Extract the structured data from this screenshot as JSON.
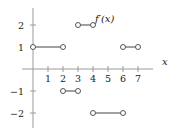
{
  "chart_data": {
    "type": "line",
    "subtype": "piecewise-constant step function with open endpoints",
    "title": "",
    "function_label": "f'(x)",
    "xlabel": "x",
    "ylabel": "",
    "xlim": [
      -0.7,
      7.9
    ],
    "ylim": [
      -2.7,
      2.8
    ],
    "x_ticks": [
      1,
      2,
      3,
      4,
      5,
      6,
      7
    ],
    "y_ticks": [
      -2,
      -1,
      1,
      2
    ],
    "grid": false,
    "legend": null,
    "segments": [
      {
        "x_start": 0,
        "x_end": 2,
        "y": 1,
        "start_open": true,
        "end_open": true
      },
      {
        "x_start": 2,
        "x_end": 3,
        "y": -1,
        "start_open": true,
        "end_open": true
      },
      {
        "x_start": 3,
        "x_end": 4,
        "y": 2,
        "start_open": true,
        "end_open": true
      },
      {
        "x_start": 4,
        "x_end": 6,
        "y": -2,
        "start_open": true,
        "end_open": true
      },
      {
        "x_start": 6,
        "x_end": 7,
        "y": 1,
        "start_open": true,
        "end_open": true
      }
    ],
    "annotations": [
      {
        "text": "f'(x)",
        "near": {
          "x": 4,
          "y": 2
        }
      }
    ]
  },
  "labels": {
    "function": "f′(x)",
    "x_axis": "x",
    "x_tick_labels": [
      "1",
      "2",
      "3",
      "4",
      "5",
      "6",
      "7"
    ],
    "y_tick_labels": [
      "2",
      "1",
      "−1",
      "−2"
    ]
  },
  "colors": {
    "axis": "#9a9a9a",
    "segment": "#555555",
    "marker_fill": "#ffffff",
    "text": "#222222"
  }
}
